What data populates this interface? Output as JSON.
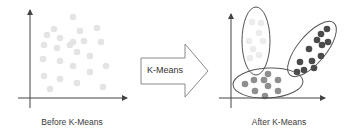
{
  "before_panel": {
    "caption": "Before K-Means",
    "axes": {
      "origin": [
        30,
        98
      ],
      "x_end": 127,
      "y_top": 10,
      "y_bottom": 108,
      "x_start": 18
    },
    "points_color": "#e4e4e4",
    "points": [
      [
        73,
        17
      ],
      [
        54,
        29
      ],
      [
        47,
        35
      ],
      [
        80,
        31
      ],
      [
        97,
        28
      ],
      [
        60,
        38
      ],
      [
        44,
        45
      ],
      [
        73,
        42
      ],
      [
        84,
        41
      ],
      [
        101,
        42
      ],
      [
        57,
        48
      ],
      [
        70,
        45
      ],
      [
        77,
        52
      ],
      [
        43,
        59
      ],
      [
        60,
        61
      ],
      [
        90,
        56
      ],
      [
        73,
        66
      ],
      [
        106,
        66
      ],
      [
        44,
        76
      ],
      [
        60,
        79
      ],
      [
        90,
        72
      ],
      [
        77,
        83
      ],
      [
        50,
        89
      ],
      [
        103,
        87
      ]
    ]
  },
  "transform_arrow": {
    "label": "K-Means",
    "stroke": "#8a8a8a"
  },
  "after_panel": {
    "caption": "After K-Means",
    "axes": {
      "origin": [
        231,
        98
      ],
      "x_end": 325,
      "y_top": 14,
      "y_bottom": 108,
      "x_start": 219
    },
    "clusters": [
      {
        "name": "cluster-light",
        "color": "#ececec",
        "ellipse": {
          "cx": 256,
          "cy": 41,
          "rx": 14,
          "ry": 34,
          "rotate": 0
        },
        "points": [
          [
            252,
            22
          ],
          [
            261,
            23
          ],
          [
            259,
            33
          ],
          [
            249,
            41
          ],
          [
            263,
            41
          ],
          [
            253,
            49
          ],
          [
            259,
            55
          ],
          [
            250,
            58
          ]
        ]
      },
      {
        "name": "cluster-dark",
        "color": "#4a4a4a",
        "ellipse": {
          "cx": 312,
          "cy": 49,
          "rx": 14,
          "ry": 34,
          "rotate": 40
        },
        "points": [
          [
            321,
            34
          ],
          [
            327,
            29
          ],
          [
            317,
            40
          ],
          [
            322,
            45
          ],
          [
            328,
            42
          ],
          [
            309,
            49
          ],
          [
            321,
            56
          ],
          [
            312,
            61
          ],
          [
            300,
            62
          ],
          [
            304,
            70
          ],
          [
            314,
            68
          ],
          [
            297,
            72
          ]
        ]
      },
      {
        "name": "cluster-medium",
        "color": "#8f8f8f",
        "ellipse": {
          "cx": 268,
          "cy": 83,
          "rx": 35,
          "ry": 15,
          "rotate": -3
        },
        "points": [
          [
            268,
            74
          ],
          [
            254,
            80
          ],
          [
            264,
            80
          ],
          [
            278,
            80
          ],
          [
            245,
            84
          ],
          [
            268,
            86
          ],
          [
            255,
            91
          ],
          [
            278,
            91
          ],
          [
            265,
            96
          ]
        ]
      }
    ]
  }
}
